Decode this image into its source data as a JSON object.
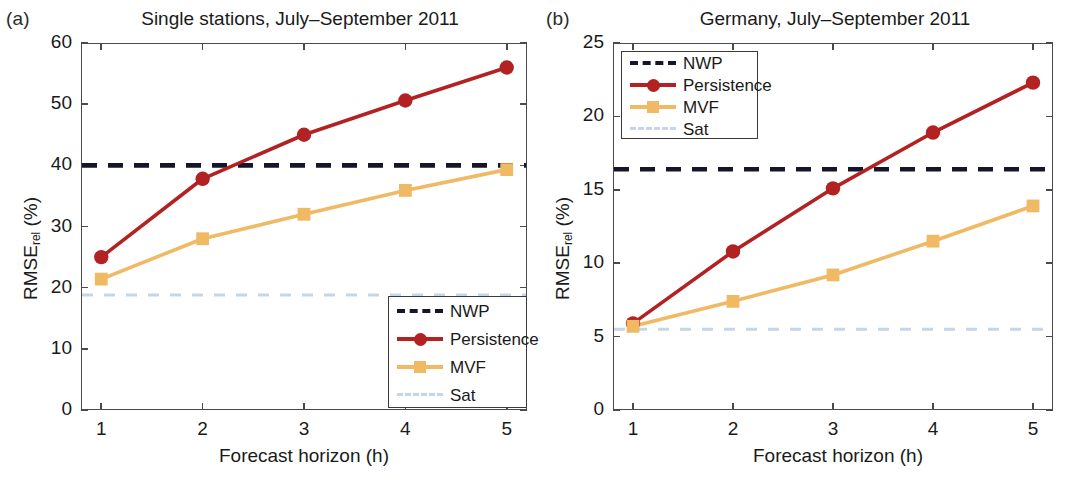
{
  "figure": {
    "background_color": "#ffffff",
    "panels": [
      {
        "tag": "(a)",
        "title": "Single stations, July–September 2011",
        "xlabel": "Forecast horizon (h)",
        "ylabel_main": "RMSE",
        "ylabel_sub": "rel",
        "ylabel_unit": " (%)",
        "ytick_labels": [
          "0",
          "10",
          "20",
          "30",
          "40",
          "50",
          "60"
        ],
        "xtick_labels": [
          "1",
          "2",
          "3",
          "4",
          "5"
        ],
        "legend_position": "bottom-right"
      },
      {
        "tag": "(b)",
        "title": "Germany, July–September 2011",
        "xlabel": "Forecast horizon (h)",
        "ylabel_main": "RMSE",
        "ylabel_sub": "rel",
        "ylabel_unit": " (%)",
        "ytick_labels": [
          "0",
          "5",
          "10",
          "15",
          "20",
          "25"
        ],
        "xtick_labels": [
          "1",
          "2",
          "3",
          "4",
          "5"
        ],
        "legend_position": "top-left"
      }
    ]
  },
  "colors": {
    "persistence": "#b22222",
    "mvf": "#f0b963",
    "nwp": "#16162b",
    "sat": "#c5d5ea",
    "axis": "#4a4a4a",
    "text": "#1a1a1a"
  },
  "legend": {
    "entries": [
      {
        "label": "NWP",
        "style": "dashed-dark",
        "marker": "none"
      },
      {
        "label": "Persistence",
        "style": "solid",
        "marker": "circle"
      },
      {
        "label": "MVF",
        "style": "solid",
        "marker": "square"
      },
      {
        "label": "Sat",
        "style": "dashed-light",
        "marker": "none"
      }
    ]
  },
  "chart_data": [
    {
      "type": "line",
      "panel": "(a)",
      "title": "Single stations, July–September 2011",
      "xlabel": "Forecast horizon (h)",
      "ylabel": "RMSE_rel (%)",
      "x": [
        1,
        2,
        3,
        4,
        5
      ],
      "xlim": [
        0.8,
        5.2
      ],
      "ylim": [
        0,
        60
      ],
      "xticks": [
        1,
        2,
        3,
        4,
        5
      ],
      "yticks": [
        0,
        10,
        20,
        30,
        40,
        50,
        60
      ],
      "grid": false,
      "legend_position": "lower right",
      "series": [
        {
          "name": "NWP",
          "type": "hline",
          "value": 40.0,
          "style": "dashed",
          "color": "#16162b"
        },
        {
          "name": "Persistence",
          "type": "marker-line",
          "values": [
            25.0,
            37.8,
            45.0,
            50.6,
            56.0
          ],
          "marker": "circle",
          "color": "#b22222"
        },
        {
          "name": "MVF",
          "type": "marker-line",
          "values": [
            21.4,
            28.0,
            32.0,
            35.9,
            39.3
          ],
          "marker": "square",
          "color": "#f0b963"
        },
        {
          "name": "Sat",
          "type": "hline",
          "value": 18.8,
          "style": "dashed",
          "color": "#c5d5ea"
        }
      ]
    },
    {
      "type": "line",
      "panel": "(b)",
      "title": "Germany, July–September 2011",
      "xlabel": "Forecast horizon (h)",
      "ylabel": "RMSE_rel (%)",
      "x": [
        1,
        2,
        3,
        4,
        5
      ],
      "xlim": [
        0.8,
        5.2
      ],
      "ylim": [
        0,
        25
      ],
      "xticks": [
        1,
        2,
        3,
        4,
        5
      ],
      "yticks": [
        0,
        5,
        10,
        15,
        20,
        25
      ],
      "grid": false,
      "legend_position": "upper left",
      "series": [
        {
          "name": "NWP",
          "type": "hline",
          "value": 16.4,
          "style": "dashed",
          "color": "#16162b"
        },
        {
          "name": "Persistence",
          "type": "marker-line",
          "values": [
            5.9,
            10.8,
            15.1,
            18.9,
            22.3
          ],
          "marker": "circle",
          "color": "#b22222"
        },
        {
          "name": "MVF",
          "type": "marker-line",
          "values": [
            5.7,
            7.4,
            9.2,
            11.5,
            13.9
          ],
          "marker": "square",
          "color": "#f0b963"
        },
        {
          "name": "Sat",
          "type": "hline",
          "value": 5.5,
          "style": "dashed",
          "color": "#c5d5ea"
        }
      ]
    }
  ]
}
